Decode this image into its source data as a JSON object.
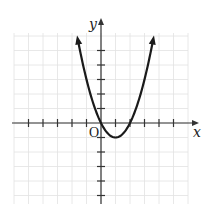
{
  "chart_data": {
    "type": "line",
    "title": "",
    "xlabel": "x",
    "ylabel": "y",
    "origin_label": "O",
    "equation": "y = x^2 - 2x",
    "vertex": [
      1,
      -1
    ],
    "x_intercepts": [
      0,
      2
    ],
    "xlim": [
      -6,
      6
    ],
    "ylim": [
      -5.5,
      6.2
    ],
    "grid": true,
    "x_ticks": [
      -5,
      -4,
      -3,
      -2,
      -1,
      1,
      2,
      3,
      4,
      5
    ],
    "y_ticks": [
      -5,
      -4,
      -3,
      -2,
      -1,
      1,
      2,
      3,
      4,
      5
    ],
    "series": [
      {
        "name": "parabola",
        "x": [
          -1.6,
          -1,
          0,
          1,
          2,
          3,
          3.6
        ],
        "values": [
          5.76,
          3,
          0,
          -1,
          0,
          3,
          5.76
        ],
        "arrows_at_ends": true
      }
    ]
  },
  "colors": {
    "curve": "#1a1a1a",
    "axes": "#333333",
    "grid": "#e2e2e2"
  }
}
